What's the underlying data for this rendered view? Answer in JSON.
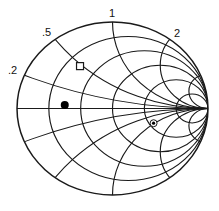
{
  "diagram": {
    "type": "smith-chart",
    "center": [
      112.5,
      108.5
    ],
    "radius_x": 95.5,
    "radius_y": 86.5,
    "line_color": "#1a1a1a",
    "resistance_circles": [
      0.2,
      0.5,
      1,
      2,
      5
    ],
    "reactance_arcs": [
      0.2,
      0.5,
      1,
      2,
      5
    ],
    "labels": [
      {
        "text": ".2",
        "x": 8,
        "y": 65
      },
      {
        "text": ".5",
        "x": 42,
        "y": 27
      },
      {
        "text": "1",
        "x": 109,
        "y": 8
      },
      {
        "text": "2",
        "x": 174,
        "y": 28
      }
    ],
    "markers": [
      {
        "name": "open-square-marker",
        "shape": "square",
        "u": -0.34,
        "v": 0.49
      },
      {
        "name": "filled-dot-marker",
        "shape": "dot",
        "u": -0.5,
        "v": 0.04
      },
      {
        "name": "circled-dot-marker",
        "shape": "circled-dot",
        "u": 0.43,
        "v": -0.17
      }
    ]
  }
}
